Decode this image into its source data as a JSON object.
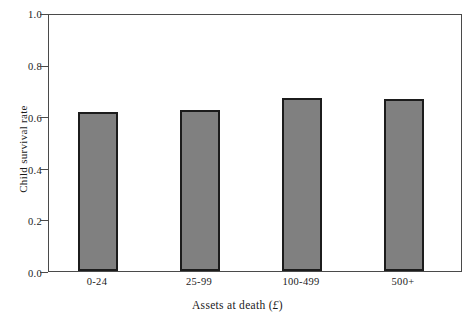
{
  "chart_data": {
    "type": "bar",
    "title": "",
    "subtitle": "",
    "xlabel": "Assets at death (£)",
    "ylabel": "Child survival rate",
    "categories": [
      "0-24",
      "25-99",
      "100-499",
      "500+"
    ],
    "values": [
      0.62,
      0.63,
      0.675,
      0.67
    ],
    "series": [
      {
        "name": "Child survival rate",
        "values": [
          0.62,
          0.63,
          0.675,
          0.67
        ]
      }
    ],
    "ylim": [
      0.0,
      1.0
    ],
    "ytick_labels": [
      "0.0",
      "0.2",
      "0.4",
      "0.6",
      "0.8",
      "1.0"
    ],
    "ytick_values": [
      0.0,
      0.2,
      0.4,
      0.6,
      0.8,
      1.0
    ],
    "xtick_labels": [
      "0-24",
      "25-99",
      "100-499",
      "500+"
    ],
    "grid": false,
    "legend": null,
    "legend_position": "none",
    "annotations": [],
    "bar_fill_color": "#808080",
    "bar_edge_color": "#1c1c1c",
    "axis_color": "#4a4a4a",
    "background_color": "#ffffff"
  },
  "axes": {
    "y_title": "Child survival rate",
    "x_title_prefix": "Assets at death (",
    "x_title_currency": "£",
    "x_title_suffix": ")"
  }
}
